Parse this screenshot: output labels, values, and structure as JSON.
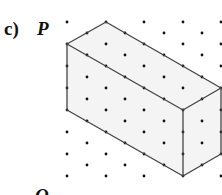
{
  "figure": {
    "part_label": "c)",
    "vertex_labels": {
      "top": "P",
      "bottom": "Q"
    },
    "colors": {
      "dot": "#111111",
      "edge": "#444444",
      "face_fill": "#f4f4f4",
      "background": "#ffffff"
    },
    "grid": {
      "type": "isometric-dot",
      "even_columns_x": [
        67,
        106,
        144,
        183,
        221
      ],
      "even_rows_y": [
        22,
        44,
        66,
        88,
        110,
        132,
        154,
        176
      ],
      "odd_columns_x": [
        87,
        125,
        164,
        202
      ],
      "odd_rows_y": [
        33,
        55,
        77,
        99,
        121,
        143,
        165
      ]
    },
    "cuboid": {
      "vertices": {
        "top_left": [
          67,
          44
        ],
        "top_back": [
          106,
          22
        ],
        "top_right": [
          221,
          88
        ],
        "front_top": [
          183,
          110
        ],
        "bottom_left": [
          67,
          110
        ],
        "front_bottom": [
          183,
          176
        ],
        "right_bottom": [
          221,
          154
        ]
      }
    }
  }
}
